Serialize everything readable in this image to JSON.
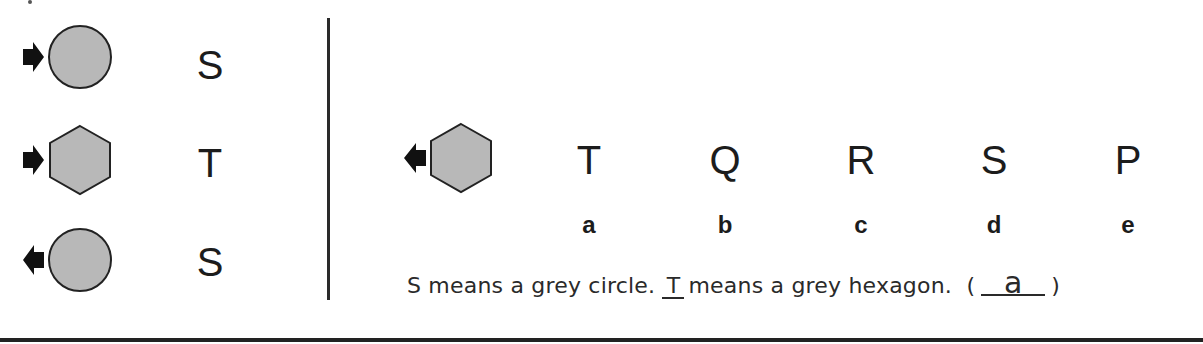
{
  "colors": {
    "shape_fill": "#b8b8b8",
    "shape_stroke": "#222222",
    "arrow": "#111111",
    "text": "#1c1c1c",
    "line": "#2a2a2a"
  },
  "left_panel": {
    "rows": [
      {
        "shape": "circle",
        "arrow_direction": "right",
        "letter": "S"
      },
      {
        "shape": "hexagon",
        "arrow_direction": "right",
        "letter": "T"
      },
      {
        "shape": "circle",
        "arrow_direction": "left",
        "letter": "S"
      }
    ]
  },
  "right_panel": {
    "question_shape": {
      "shape": "hexagon",
      "arrow_direction": "left"
    },
    "options": [
      {
        "letter": "T",
        "label": "a"
      },
      {
        "letter": "Q",
        "label": "b"
      },
      {
        "letter": "R",
        "label": "c"
      },
      {
        "letter": "S",
        "label": "d"
      },
      {
        "letter": "P",
        "label": "e"
      }
    ]
  },
  "statement": {
    "part1": "S means a grey circle.",
    "filled_letter": "T",
    "part2": "means a grey hexagon.",
    "open_paren": "(",
    "answer": "a",
    "close_paren": ")"
  }
}
